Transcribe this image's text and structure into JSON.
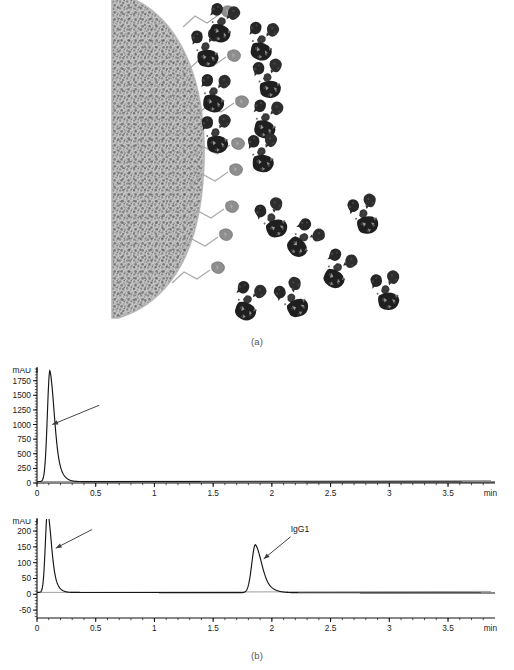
{
  "figure": {
    "panels": [
      {
        "id": "a",
        "caption": "(a)",
        "type": "schematic"
      },
      {
        "id": "b",
        "caption": "(b)",
        "type": "chromatograms"
      }
    ]
  },
  "schematic": {
    "name": "affinity-chromatography-bead-schematic",
    "description": "Porous resin bead with immobilized ligands bound to antibody molecules, plus free antibodies in solution",
    "bead": {
      "fill_color": "#b9b9b9",
      "texture": "speckled",
      "edge_color": "#9a9a9a"
    },
    "linker_color": "#a0a0a0",
    "ligand_color": "#8e8e8e",
    "protein_color": "#2b2b2b",
    "bound_antibody_count": 5,
    "free_antibody_count": 7,
    "ligand_only_count": 4
  },
  "chart_data": [
    {
      "type": "line",
      "name": "chromatogram-flowthrough",
      "panel": "b-top",
      "title": "",
      "xlabel": "min",
      "ylabel": "mAU",
      "xlim": [
        0,
        3.9
      ],
      "ylim": [
        0,
        1950
      ],
      "grid": false,
      "legend": null,
      "xticks": [
        "0",
        "0.5",
        "1",
        "1.5",
        "2",
        "2.5",
        "3",
        "3.5"
      ],
      "xtick_values": [
        0,
        0.5,
        1,
        1.5,
        2,
        2.5,
        3,
        3.5
      ],
      "yticks": [
        "0",
        "250",
        "500",
        "750",
        "1000",
        "1250",
        "1500",
        "1750"
      ],
      "ytick_values": [
        0,
        250,
        500,
        750,
        1000,
        1250,
        1500,
        1750
      ],
      "peaks": [
        {
          "label": "flowthrough",
          "retention_time_min": 0.11,
          "height_mAU": 1900,
          "width_min": 0.035
        }
      ],
      "annotations": [
        {
          "text": "",
          "points_to_time_min": 0.13,
          "points_to_mAU": 1000,
          "arrow_from_time_min": 0.53,
          "arrow_from_mAU": 1330
        }
      ],
      "baseline_mAU": 25
    },
    {
      "type": "line",
      "name": "chromatogram-elution",
      "panel": "b-bottom",
      "title": "",
      "xlabel": "min",
      "ylabel": "mAU",
      "xlim": [
        0,
        3.9
      ],
      "ylim": [
        -75,
        235
      ],
      "grid": false,
      "legend": null,
      "xticks": [
        "0",
        "0.5",
        "1",
        "1.5",
        "2",
        "2.5",
        "3",
        "3.5"
      ],
      "xtick_values": [
        0,
        0.5,
        1,
        1.5,
        2,
        2.5,
        3,
        3.5
      ],
      "yticks": [
        "-50",
        "0",
        "50",
        "100",
        "150",
        "200"
      ],
      "ytick_values": [
        -50,
        0,
        50,
        100,
        150,
        200
      ],
      "peaks": [
        {
          "label": "flowthrough",
          "retention_time_min": 0.09,
          "height_mAU": 260,
          "width_min": 0.03,
          "clipped": true
        },
        {
          "label": "IgG1",
          "retention_time_min": 1.86,
          "height_mAU": 152,
          "width_min": 0.05
        }
      ],
      "annotations": [
        {
          "text": "IgG1",
          "text_time_min": 2.16,
          "text_mAU": 196,
          "points_to_time_min": 1.93,
          "points_to_mAU": 112,
          "arrow_from_time_min": 2.16,
          "arrow_from_mAU": 182
        },
        {
          "text": "",
          "points_to_time_min": 0.16,
          "points_to_mAU": 146,
          "arrow_from_time_min": 0.47,
          "arrow_from_mAU": 205
        }
      ],
      "baseline_mAU": 6
    }
  ],
  "axis_units": {
    "y_unit": "mAU",
    "x_unit": "min"
  }
}
